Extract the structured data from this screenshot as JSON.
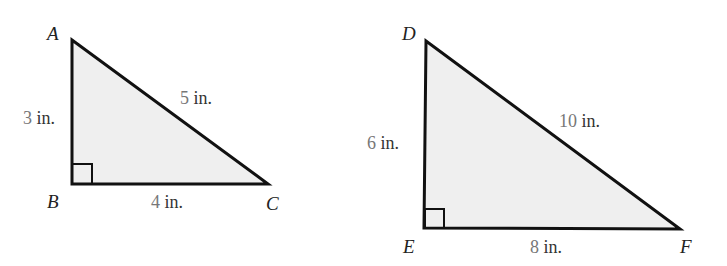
{
  "figure": {
    "colors": {
      "fill": "#efefef",
      "stroke": "#111111",
      "number": "#777777",
      "unit_text": "#333333"
    },
    "triangles": [
      {
        "id": "ABC",
        "vertices": {
          "A": "A",
          "B": "B",
          "C": "C"
        },
        "sides": {
          "AB": {
            "value": "3",
            "unit": " in."
          },
          "BC": {
            "value": "4",
            "unit": " in."
          },
          "AC": {
            "value": "5",
            "unit": " in."
          }
        },
        "right_angle_at": "B"
      },
      {
        "id": "DEF",
        "vertices": {
          "D": "D",
          "E": "E",
          "F": "F"
        },
        "sides": {
          "DE": {
            "value": "6",
            "unit": " in."
          },
          "EF": {
            "value": "8",
            "unit": " in."
          },
          "DF": {
            "value": "10",
            "unit": " in."
          }
        },
        "right_angle_at": "E"
      }
    ]
  }
}
